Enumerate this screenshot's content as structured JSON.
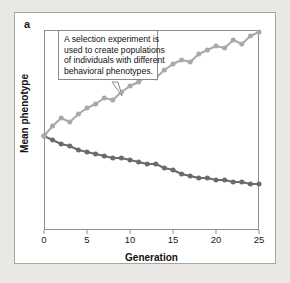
{
  "figure": {
    "panel_letter": "a",
    "callout": {
      "lines": [
        "A selection experiment is",
        "used to create populations",
        "of individuals with different",
        "behavioral phenotypes."
      ]
    }
  },
  "colors": {
    "page_background": "#e9e8e5",
    "card_background": "#ffffff",
    "frame": "#8e8e8c",
    "high_line": "#a9a9a9",
    "low_line": "#6b6b6b",
    "text": "#111111"
  },
  "chart_data": {
    "type": "line",
    "title": "",
    "xlabel": "Generation",
    "ylabel": "Mean phenotype",
    "xlim": [
      0,
      25
    ],
    "ylim": [
      0,
      100
    ],
    "xticks": [
      0,
      5,
      10,
      15,
      20,
      25
    ],
    "yticks": [],
    "grid": false,
    "legend": "none",
    "markers": "circle",
    "x": [
      0,
      1,
      2,
      3,
      4,
      5,
      6,
      7,
      8,
      9,
      10,
      11,
      12,
      13,
      14,
      15,
      16,
      17,
      18,
      19,
      20,
      21,
      22,
      23,
      24,
      25
    ],
    "series": [
      {
        "name": "High-selected line",
        "color": "#a9a9a9",
        "values": [
          47,
          52,
          56,
          54,
          58,
          61,
          63,
          66,
          65,
          69,
          72,
          74,
          77,
          76,
          80,
          83,
          85,
          84,
          88,
          90,
          92,
          91,
          95,
          93,
          97,
          99
        ]
      },
      {
        "name": "Low-selected line",
        "color": "#6b6b6b",
        "values": [
          47,
          45,
          43,
          42,
          40,
          39,
          38,
          37,
          36,
          36,
          35,
          34,
          33,
          33,
          31,
          30,
          28,
          27,
          26,
          26,
          25,
          25,
          24,
          24,
          23,
          23
        ]
      }
    ]
  }
}
